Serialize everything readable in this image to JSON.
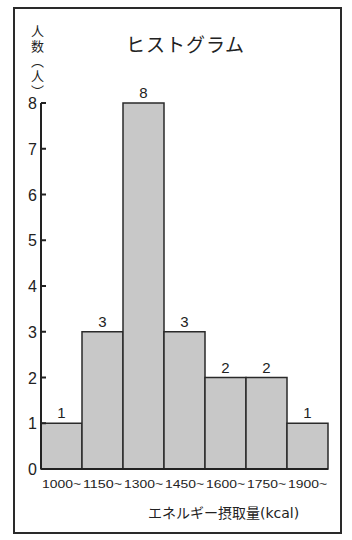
{
  "chart_data": {
    "type": "bar",
    "title": "ヒストグラム",
    "xlabel": "エネルギー摂取量(kcal)",
    "ylabel": "人数(人)",
    "categories": [
      "1000~",
      "1150~",
      "1300~",
      "1450~",
      "1600~",
      "1750~",
      "1900~"
    ],
    "values": [
      1,
      3,
      8,
      3,
      2,
      2,
      1
    ],
    "y_ticks": [
      0,
      1,
      2,
      3,
      4,
      5,
      6,
      7,
      8
    ],
    "ylim": [
      0,
      8
    ],
    "grid": false,
    "legend": null,
    "bar_color": "#c8c8c8",
    "edge_color": "#2a2a2a",
    "data_labels": true
  },
  "ylabel_chars": [
    "人",
    "数",
    "︵",
    "人",
    "︶"
  ]
}
